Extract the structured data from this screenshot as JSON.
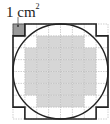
{
  "label": {
    "value": "1 cm",
    "exponent": "2"
  },
  "grid": {
    "rows": 8,
    "cols": 8,
    "cell_size_cm": 1,
    "shaded_rows": [
      [],
      [
        2,
        3,
        4,
        5
      ],
      [
        1,
        2,
        3,
        4,
        5,
        6
      ],
      [
        1,
        2,
        3,
        4,
        5,
        6
      ],
      [
        1,
        2,
        3,
        4,
        5,
        6
      ],
      [
        1,
        2,
        3,
        4,
        5,
        6
      ],
      [
        2,
        3,
        4,
        5
      ],
      []
    ],
    "marker_cell": {
      "row": 0,
      "col": 0
    }
  },
  "colors": {
    "shade": "#d6d6d6",
    "marker": "#9a9a9a",
    "grid_line": "#b0b0b0",
    "outline": "#222222"
  }
}
